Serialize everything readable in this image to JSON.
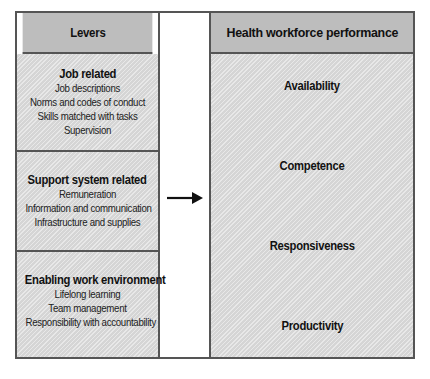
{
  "levers": {
    "header": "Levers",
    "sections": [
      {
        "title": "Job related",
        "items": [
          "Job descriptions",
          "Norms and codes of conduct",
          "Skills matched with tasks",
          "Supervision"
        ]
      },
      {
        "title": "Support system related",
        "items": [
          "Remuneration",
          "Information and communication",
          "Infrastructure and supplies"
        ]
      },
      {
        "title": "Enabling work environment",
        "items": [
          "Lifelong learning",
          "Team management",
          "Responsibility with accountability"
        ]
      }
    ]
  },
  "connector": {
    "icon": "right-arrow-icon"
  },
  "performance": {
    "header": "Health workforce performance",
    "outcomes": [
      "Availability",
      "Competence",
      "Responsiveness",
      "Productivity"
    ]
  },
  "colors": {
    "header_fill": "#bdbdbd",
    "body_fill": "#dcdcdc",
    "border": "#555555"
  }
}
